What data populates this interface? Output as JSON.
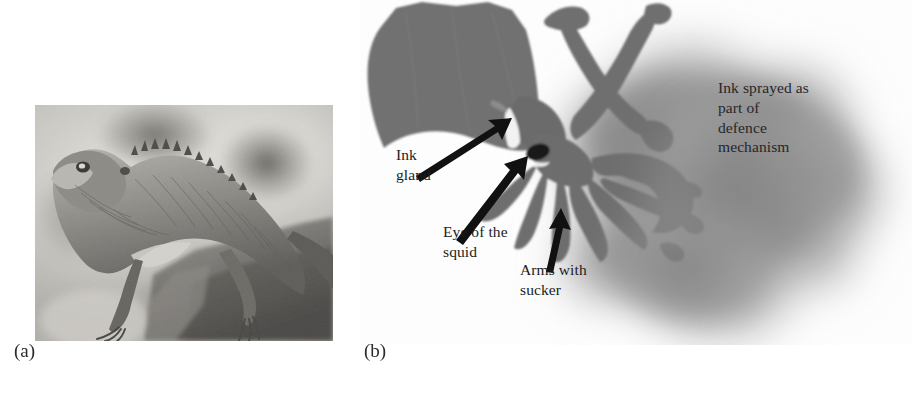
{
  "figure": {
    "background_color": "#ffffff",
    "width": 912,
    "height": 399,
    "panels": [
      {
        "key": "a",
        "caption": "(a)",
        "subject": "lizard-photograph"
      },
      {
        "key": "b",
        "caption": "(b)",
        "subject": "squid-ink-diagram"
      }
    ]
  },
  "panel_a": {
    "caption": "(a)",
    "image_alt": "Grayscale photograph of a garden lizard perched on a rock",
    "image_type": "photograph",
    "colors": {
      "background_light": "#d9d7d2",
      "background_mid": "#b0aea9",
      "background_dark": "#8a8884",
      "subject_mid": "#9c9a95",
      "subject_dark": "#55534f",
      "subject_light": "#cfcdc8"
    }
  },
  "panel_b": {
    "caption": "(b)",
    "image_alt": "Grayscale silhouette of a squid releasing a cloud of ink",
    "image_type": "photograph-silhouette",
    "colors": {
      "squid_body": "#6f6f6f",
      "squid_body_dark": "#5e5e5e",
      "eye_spot": "#111111",
      "ink_cloud": "#8a8a8a",
      "ink_cloud_dense": "#7c7c7c",
      "arrow": "#101010",
      "background": "#ffffff"
    },
    "callouts": [
      {
        "name": "ink-gland",
        "text": "Ink\ngland",
        "lines": [
          "Ink",
          "gland"
        ],
        "arrow": "points up-right toward the mantle opening"
      },
      {
        "name": "eye-of-the-squid",
        "text": "Eye of the\nsquid",
        "lines": [
          "Eye of the",
          "squid"
        ],
        "arrow": "points up-right toward the dark eye spot"
      },
      {
        "name": "arms-with-sucker",
        "text": "Arms with\nsucker",
        "lines": [
          "Arms with",
          "sucker"
        ],
        "arrow": "points straight up toward the arms"
      },
      {
        "name": "ink-sprayed",
        "text": "Ink sprayed as\npart of\ndefence\nmechanism",
        "lines": [
          "Ink sprayed as",
          "part of",
          "defence",
          "mechanism"
        ],
        "arrow": "none"
      }
    ]
  }
}
